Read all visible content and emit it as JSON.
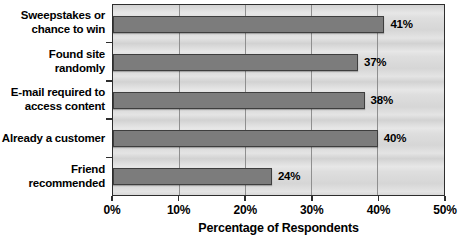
{
  "chart_data": {
    "type": "bar",
    "orientation": "horizontal",
    "title": "",
    "categories": [
      "Sweepstakes or\nchance to win",
      "Found site randomly",
      "E-mail required to\naccess content",
      "Already a customer",
      "Friend recommended"
    ],
    "values": [
      41,
      37,
      38,
      40,
      24
    ],
    "value_labels": [
      "41%",
      "37%",
      "38%",
      "40%",
      "24%"
    ],
    "xlabel": "Percentage of Respondents",
    "ylabel": "",
    "xlim": [
      0,
      50
    ],
    "x_ticks": [
      0,
      10,
      20,
      30,
      40,
      50
    ],
    "x_tick_labels": [
      "0%",
      "10%",
      "20%",
      "30%",
      "40%",
      "50%"
    ],
    "grid": "vertical gridlines at every 10%",
    "legend": "none",
    "colors": {
      "bar_fill": "#7c7c7c",
      "bar_border": "#3e3e3e",
      "plot_background": "#dadada",
      "gridline": "#8f8f8f",
      "plot_border": "#2e2e2e",
      "text": "#000000",
      "page_background": "#ffffff"
    }
  }
}
